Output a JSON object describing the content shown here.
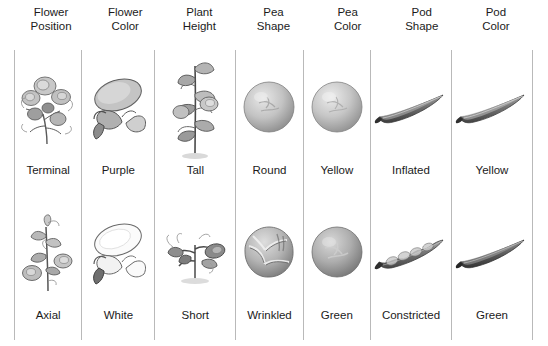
{
  "figure": {
    "background_color": "#ffffff",
    "divider_color": "#b9b9b9",
    "text_color": "#1b1b1b"
  },
  "columns": [
    {
      "header_line1": "Flower",
      "header_line2": "Position",
      "dominant_label": "Terminal",
      "dominant_icon": "terminal-flower-cluster-icon",
      "recessive_label": "Axial",
      "recessive_icon": "axial-flower-stem-icon"
    },
    {
      "header_line1": "Flower",
      "header_line2": "Color",
      "dominant_label": "Purple",
      "dominant_icon": "purple-flower-icon",
      "recessive_label": "White",
      "recessive_icon": "white-flower-icon"
    },
    {
      "header_line1": "Plant",
      "header_line2": "Height",
      "dominant_label": "Tall",
      "dominant_icon": "tall-plant-icon",
      "recessive_label": "Short",
      "recessive_icon": "short-plant-icon"
    },
    {
      "header_line1": "Pea",
      "header_line2": "Shape",
      "dominant_label": "Round",
      "dominant_icon": "round-pea-icon",
      "recessive_label": "Wrinkled",
      "recessive_icon": "wrinkled-pea-icon"
    },
    {
      "header_line1": "Pea",
      "header_line2": "Color",
      "dominant_label": "Yellow",
      "dominant_icon": "yellow-pea-icon",
      "recessive_label": "Green",
      "recessive_icon": "green-pea-icon"
    },
    {
      "header_line1": "Pod",
      "header_line2": "Shape",
      "dominant_label": "Inflated",
      "dominant_icon": "inflated-pod-icon",
      "recessive_label": "Constricted",
      "recessive_icon": "constricted-pod-icon"
    },
    {
      "header_line1": "Pod",
      "header_line2": "Color",
      "dominant_label": "Yellow",
      "dominant_icon": "yellow-pod-icon",
      "recessive_label": "Green",
      "recessive_icon": "green-pod-icon"
    }
  ]
}
